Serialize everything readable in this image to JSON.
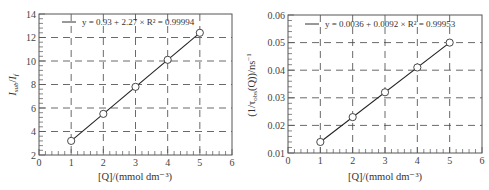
{
  "chart_data": [
    {
      "type": "scatter",
      "title": "",
      "xlabel": "[Q]/(mmol dm⁻³)",
      "ylabel": "I_sub/I_f",
      "ylabel_parts": {
        "main": "I",
        "sub1": "sub",
        "sep": "/",
        "main2": "I",
        "sub2": "f"
      },
      "xlim": [
        0,
        6
      ],
      "ylim": [
        2,
        14
      ],
      "xticks": [
        "0",
        "1",
        "2",
        "3",
        "4",
        "5",
        "6"
      ],
      "yticks": [
        "2",
        "4",
        "6",
        "8",
        "10",
        "12",
        "14"
      ],
      "grid": true,
      "grid_style": "dashed",
      "legend": {
        "position": "top-left",
        "entry": "y = 0.93 + 2.27 × R² = 0.99994"
      },
      "series": [
        {
          "name": "data",
          "marker": "open-circle",
          "x": [
            1,
            2,
            3,
            4,
            5
          ],
          "y": [
            3.2,
            5.5,
            7.8,
            10.1,
            12.4
          ]
        },
        {
          "name": "linear fit",
          "style": "line",
          "intercept": 0.93,
          "slope": 2.27,
          "r_squared": 0.99994,
          "x": [
            1,
            5
          ],
          "y": [
            3.2,
            12.28
          ]
        }
      ]
    },
    {
      "type": "scatter",
      "title": "",
      "xlabel": "[Q]/(mmol dm⁻³)",
      "ylabel": "(1/τ_obs(Q))/ns⁻¹",
      "ylabel_parts": {
        "pre": "(1/τ",
        "sub": "obs",
        "post": "(Q))/ns",
        "sup": "−1"
      },
      "xlim": [
        0,
        6
      ],
      "ylim": [
        0.01,
        0.06
      ],
      "xticks": [
        "0",
        "1",
        "2",
        "3",
        "4",
        "5",
        "6"
      ],
      "yticks": [
        "0.01",
        "0.02",
        "0.03",
        "0.04",
        "0.05",
        "0.06"
      ],
      "grid": true,
      "grid_style": "dashed",
      "legend": {
        "position": "top-left",
        "entry": "y = 0.0036 + 0.0092 × R² = 0.99953"
      },
      "series": [
        {
          "name": "data",
          "marker": "open-circle",
          "x": [
            1,
            2,
            3,
            4,
            5
          ],
          "y": [
            0.014,
            0.023,
            0.032,
            0.041,
            0.05
          ]
        },
        {
          "name": "linear fit",
          "style": "line",
          "intercept": 0.0036,
          "slope": 0.0092,
          "r_squared": 0.99953,
          "x": [
            1,
            5
          ],
          "y": [
            0.0128,
            0.0496
          ]
        }
      ]
    }
  ]
}
